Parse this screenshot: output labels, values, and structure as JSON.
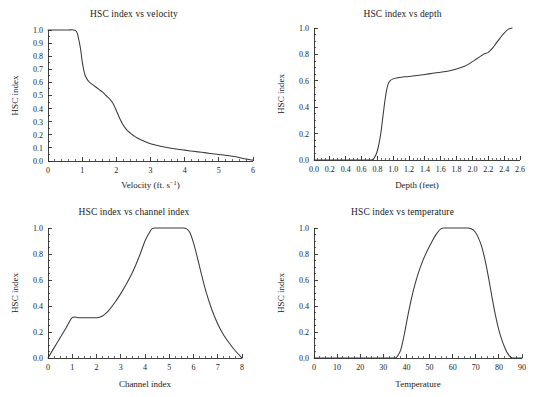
{
  "figure": {
    "name": "hsc-index-suitability-curves",
    "panel_count": 4
  },
  "chart_data": [
    {
      "id": "velocity",
      "type": "line",
      "title": "HSC index vs velocity",
      "xlabel": "Velocity (ft. s",
      "xlabel_sup": "−1",
      "xlabel_tail": ")",
      "ylabel": "HSC index",
      "xlim": [
        0,
        6
      ],
      "ylim": [
        0,
        1.0
      ],
      "xticks": [
        0,
        1,
        2,
        3,
        4,
        5,
        6
      ],
      "xtick_labels": [
        "0",
        "1",
        "2",
        "3",
        "4",
        "5",
        "6"
      ],
      "yticks": [
        0.0,
        0.1,
        0.2,
        0.3,
        0.4,
        0.5,
        0.6,
        0.7,
        0.8,
        0.9,
        1.0
      ],
      "ytick_labels": [
        "0.0",
        "0.1",
        "0.2",
        "0.3",
        "0.4",
        "0.5",
        "0.6",
        "0.7",
        "0.8",
        "0.9",
        "1.0"
      ],
      "x_minor_step": 0.2,
      "y_minor_step": 0.05,
      "grid": false,
      "legend": "none",
      "x": [
        0.0,
        0.2,
        0.4,
        0.6,
        0.75,
        0.85,
        0.95,
        1.0,
        1.05,
        1.1,
        1.2,
        1.3,
        1.4,
        1.5,
        1.6,
        1.7,
        1.8,
        1.9,
        2.0,
        2.1,
        2.2,
        2.3,
        2.4,
        2.5,
        2.6,
        2.8,
        3.0,
        3.2,
        3.4,
        3.6,
        3.8,
        4.0,
        4.25,
        4.5,
        4.75,
        5.0,
        5.25,
        5.5,
        5.75,
        6.0
      ],
      "y": [
        1.0,
        1.0,
        1.0,
        1.0,
        1.0,
        0.98,
        0.86,
        0.76,
        0.69,
        0.645,
        0.605,
        0.585,
        0.565,
        0.545,
        0.525,
        0.5,
        0.475,
        0.44,
        0.385,
        0.325,
        0.275,
        0.24,
        0.215,
        0.195,
        0.178,
        0.152,
        0.132,
        0.118,
        0.107,
        0.098,
        0.09,
        0.083,
        0.074,
        0.066,
        0.058,
        0.05,
        0.042,
        0.032,
        0.018,
        0.005
      ]
    },
    {
      "id": "depth",
      "type": "line",
      "title": "HSC index vs depth",
      "xlabel": "Depth (feet)",
      "ylabel": "HSC index",
      "xlim": [
        0,
        2.6
      ],
      "ylim": [
        0,
        1.0
      ],
      "xticks": [
        0.0,
        0.2,
        0.4,
        0.6,
        0.8,
        1.0,
        1.2,
        1.4,
        1.6,
        1.8,
        2.0,
        2.2,
        2.4,
        2.6
      ],
      "xtick_labels": [
        "0.0",
        "0.2",
        "0.4",
        "0.6",
        "0.8",
        "1.0",
        "1.2",
        "1.4",
        "1.6",
        "1.8",
        "2.0",
        "2.2",
        "2.4",
        "2.6"
      ],
      "yticks": [
        0.0,
        0.2,
        0.4,
        0.6,
        0.8,
        1.0
      ],
      "ytick_labels": [
        "0.0",
        "0.2",
        "0.4",
        "0.6",
        "0.8",
        "1.0"
      ],
      "x_minor_step": 0.05,
      "y_minor_step": 0.05,
      "grid": false,
      "legend": "none",
      "x": [
        0.0,
        0.3,
        0.6,
        0.72,
        0.76,
        0.8,
        0.84,
        0.87,
        0.9,
        0.93,
        0.96,
        1.0,
        1.05,
        1.1,
        1.2,
        1.3,
        1.4,
        1.5,
        1.6,
        1.7,
        1.8,
        1.9,
        2.0,
        2.05,
        2.1,
        2.15,
        2.2,
        2.25,
        2.3,
        2.35,
        2.4,
        2.45,
        2.5
      ],
      "y": [
        0.0,
        0.0,
        0.0,
        0.0,
        0.015,
        0.07,
        0.19,
        0.33,
        0.47,
        0.565,
        0.6,
        0.615,
        0.622,
        0.627,
        0.633,
        0.64,
        0.648,
        0.657,
        0.665,
        0.675,
        0.69,
        0.71,
        0.745,
        0.765,
        0.785,
        0.805,
        0.815,
        0.845,
        0.885,
        0.925,
        0.962,
        0.99,
        1.0
      ]
    },
    {
      "id": "channel-index",
      "type": "line",
      "title": "HSC index vs channel index",
      "xlabel": "Channel index",
      "ylabel": "HSC index",
      "xlim": [
        0,
        8
      ],
      "ylim": [
        0,
        1.0
      ],
      "xticks": [
        0,
        1,
        2,
        3,
        4,
        5,
        6,
        7,
        8
      ],
      "xtick_labels": [
        "0",
        "1",
        "2",
        "3",
        "4",
        "5",
        "6",
        "7",
        "8"
      ],
      "yticks": [
        0.0,
        0.2,
        0.4,
        0.6,
        0.8,
        1.0
      ],
      "ytick_labels": [
        "0.0",
        "0.2",
        "0.4",
        "0.6",
        "0.8",
        "1.0"
      ],
      "x_minor_step": 0.25,
      "y_minor_step": 0.05,
      "grid": false,
      "legend": "none",
      "x": [
        0.0,
        0.25,
        0.5,
        0.75,
        1.0,
        1.25,
        1.5,
        1.75,
        2.0,
        2.15,
        2.3,
        2.5,
        2.75,
        3.0,
        3.25,
        3.5,
        3.75,
        4.0,
        4.15,
        4.3,
        4.5,
        5.0,
        5.5,
        5.7,
        5.85,
        6.0,
        6.15,
        6.3,
        6.5,
        6.75,
        7.0,
        7.25,
        7.5,
        7.75,
        8.0
      ],
      "y": [
        0.0,
        0.078,
        0.155,
        0.233,
        0.31,
        0.31,
        0.31,
        0.31,
        0.31,
        0.315,
        0.33,
        0.365,
        0.425,
        0.495,
        0.575,
        0.665,
        0.775,
        0.9,
        0.955,
        0.995,
        1.0,
        1.0,
        1.0,
        0.995,
        0.965,
        0.885,
        0.78,
        0.665,
        0.52,
        0.375,
        0.262,
        0.175,
        0.108,
        0.05,
        0.0
      ]
    },
    {
      "id": "temperature",
      "type": "line",
      "title": "HSC index vs temperature",
      "xlabel": "Temperature",
      "ylabel": "HSC index",
      "xlim": [
        0,
        90
      ],
      "ylim": [
        0,
        1.0
      ],
      "xticks": [
        0,
        10,
        20,
        30,
        40,
        50,
        60,
        70,
        80,
        90
      ],
      "xtick_labels": [
        "0",
        "10",
        "20",
        "30",
        "40",
        "50",
        "60",
        "70",
        "80",
        "90"
      ],
      "yticks": [
        0.0,
        0.2,
        0.4,
        0.6,
        0.8,
        1.0
      ],
      "ytick_labels": [
        "0.0",
        "0.2",
        "0.4",
        "0.6",
        "0.8",
        "1.0"
      ],
      "x_minor_step": 2.5,
      "y_minor_step": 0.05,
      "grid": false,
      "legend": "none",
      "x": [
        0,
        10,
        20,
        30,
        35,
        36,
        37.5,
        39,
        41,
        43,
        45,
        47,
        49,
        51,
        53,
        55,
        57,
        60,
        63,
        66,
        68,
        69.5,
        71,
        72.5,
        74,
        75.5,
        77,
        78.5,
        80,
        81.5,
        83,
        84,
        85,
        86,
        90
      ],
      "y": [
        0.0,
        0.0,
        0.0,
        0.0,
        0.0,
        0.012,
        0.06,
        0.175,
        0.36,
        0.52,
        0.645,
        0.745,
        0.825,
        0.895,
        0.955,
        0.995,
        1.0,
        1.0,
        1.0,
        1.0,
        0.995,
        0.975,
        0.93,
        0.86,
        0.755,
        0.62,
        0.47,
        0.33,
        0.215,
        0.128,
        0.062,
        0.03,
        0.008,
        0.0,
        0.0
      ]
    }
  ]
}
